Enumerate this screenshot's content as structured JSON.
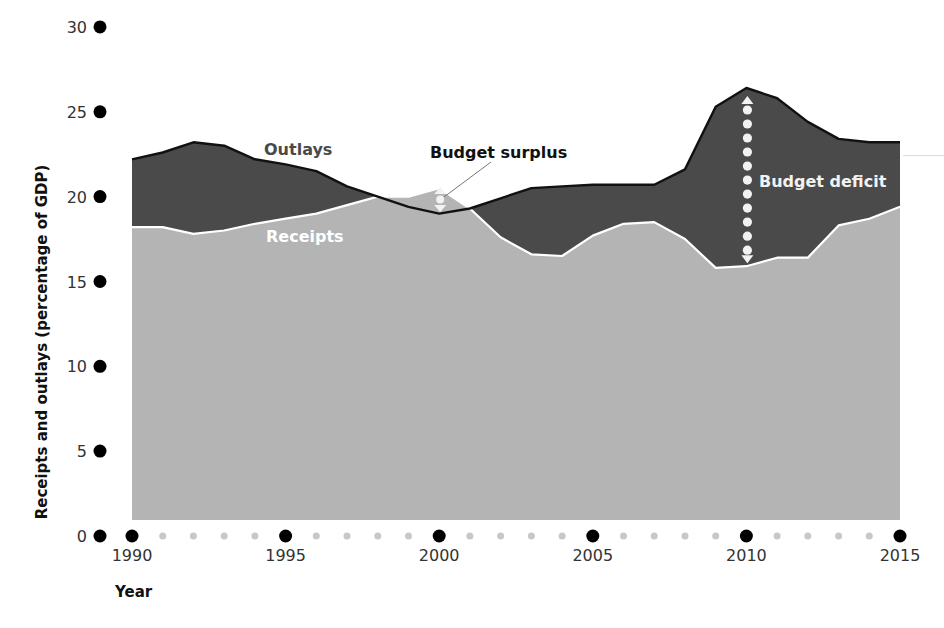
{
  "chart_data": {
    "type": "area",
    "title": "",
    "xlabel": "Year",
    "ylabel": "Receipts and outlays (percentage of GDP)",
    "xlim": [
      1989,
      2015
    ],
    "ylim": [
      0,
      30
    ],
    "grid": false,
    "legend": "inline annotations",
    "y_ticks": [
      0,
      5,
      10,
      15,
      20,
      25,
      30
    ],
    "x_ticks_major": [
      1990,
      1995,
      2000,
      2005,
      2010,
      2015
    ],
    "x": [
      1990,
      1991,
      1992,
      1993,
      1994,
      1995,
      1996,
      1997,
      1998,
      1999,
      2000,
      2001,
      2002,
      2003,
      2004,
      2005,
      2006,
      2007,
      2008,
      2009,
      2010,
      2011,
      2012,
      2013,
      2014,
      2015
    ],
    "series": [
      {
        "name": "Outlays",
        "color": "#4a4a4a",
        "values": [
          22.2,
          22.6,
          23.2,
          23.0,
          22.2,
          21.9,
          21.5,
          20.6,
          20.0,
          19.4,
          19.0,
          19.3,
          19.9,
          20.5,
          20.6,
          20.7,
          20.7,
          20.7,
          21.6,
          25.3,
          26.4,
          25.8,
          24.4,
          23.4,
          23.2,
          23.2
        ]
      },
      {
        "name": "Receipts",
        "color": "#b4b4b4",
        "values": [
          18.2,
          18.2,
          17.8,
          18.0,
          18.4,
          18.7,
          19.0,
          19.5,
          20.0,
          20.0,
          20.5,
          19.3,
          17.6,
          16.6,
          16.5,
          17.7,
          18.4,
          18.5,
          17.5,
          15.8,
          15.9,
          16.4,
          16.4,
          18.3,
          18.7,
          19.4
        ]
      }
    ],
    "annotations": [
      {
        "label": "Outlays",
        "color": "#4a4a4a"
      },
      {
        "label": "Receipts",
        "color": "#ffffff"
      },
      {
        "label": "Budget surplus",
        "color": "#111111",
        "year": 2000
      },
      {
        "label": "Budget deficit",
        "color": "#f2f2f2",
        "year": 2010
      }
    ]
  },
  "labels": {
    "xlabel": "Year",
    "ylabel": "Receipts and outlays (percentage of GDP)",
    "outlays": "Outlays",
    "receipts": "Receipts",
    "surplus": "Budget surplus",
    "deficit": "Budget deficit"
  },
  "colors": {
    "outlays_fill": "#4a4a4a",
    "receipts_fill": "#b4b4b4",
    "outlays_line": "#111111",
    "receipts_line": "#ffffff",
    "major_dot": "#000000",
    "minor_dot": "#c8c8c8"
  }
}
